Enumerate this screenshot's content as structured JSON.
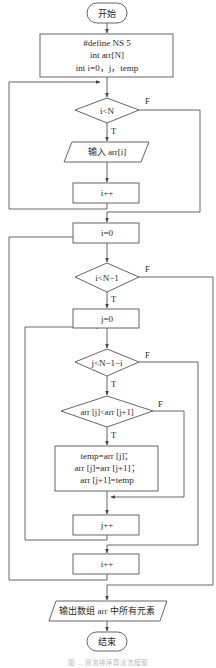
{
  "figure": {
    "type": "flowchart",
    "title": "冒泡排序算法流程图",
    "caption": "图 … 冒泡排序算法流程图"
  },
  "nodes": {
    "start": {
      "kind": "terminal",
      "lines": [
        "开始"
      ]
    },
    "init": {
      "kind": "process",
      "lines": [
        "#define NS 5",
        "int arr[N]",
        "int i=0，j，temp"
      ]
    },
    "cond1": {
      "kind": "decision",
      "lines": [
        "i<N"
      ]
    },
    "input": {
      "kind": "io",
      "lines": [
        "输入 arr[i]"
      ]
    },
    "inc_i1": {
      "kind": "process",
      "lines": [
        "i++"
      ]
    },
    "reset_i": {
      "kind": "process",
      "lines": [
        "i=0"
      ]
    },
    "cond2": {
      "kind": "decision",
      "lines": [
        "i<N−1"
      ]
    },
    "reset_j": {
      "kind": "process",
      "lines": [
        "j=0"
      ]
    },
    "cond3": {
      "kind": "decision",
      "lines": [
        "j<N−1−i"
      ]
    },
    "cond4": {
      "kind": "decision",
      "lines": [
        "arr [j]<arr [j+1]"
      ]
    },
    "swap": {
      "kind": "process",
      "lines": [
        "temp=arr [j]；",
        "arr [j]=arr [j+1]；",
        "arr [j+1]=temp"
      ]
    },
    "inc_j": {
      "kind": "process",
      "lines": [
        "j++"
      ]
    },
    "inc_i2": {
      "kind": "process",
      "lines": [
        "i++"
      ]
    },
    "output": {
      "kind": "io",
      "lines": [
        "输出数组 arr 中所有元素"
      ]
    },
    "end": {
      "kind": "terminal",
      "lines": [
        "结束"
      ]
    }
  },
  "edge_labels": {
    "true": "T",
    "false": "F"
  },
  "edges": [
    {
      "from": "start",
      "to": "init"
    },
    {
      "from": "init",
      "to": "cond1"
    },
    {
      "from": "cond1",
      "to": "input",
      "label": "T"
    },
    {
      "from": "cond1",
      "to": "reset_i",
      "label": "F"
    },
    {
      "from": "input",
      "to": "inc_i1"
    },
    {
      "from": "inc_i1",
      "to": "cond1"
    },
    {
      "from": "reset_i",
      "to": "cond2"
    },
    {
      "from": "cond2",
      "to": "reset_j",
      "label": "T"
    },
    {
      "from": "cond2",
      "to": "output",
      "label": "F"
    },
    {
      "from": "reset_j",
      "to": "cond3"
    },
    {
      "from": "cond3",
      "to": "cond4",
      "label": "T"
    },
    {
      "from": "cond3",
      "to": "inc_i2",
      "label": "F"
    },
    {
      "from": "cond4",
      "to": "swap",
      "label": "T"
    },
    {
      "from": "cond4",
      "to": "inc_j",
      "label": "F"
    },
    {
      "from": "swap",
      "to": "inc_j"
    },
    {
      "from": "inc_j",
      "to": "cond3"
    },
    {
      "from": "inc_i2",
      "to": "cond2"
    },
    {
      "from": "output",
      "to": "end"
    }
  ],
  "colors": {
    "stroke": "#555555",
    "text": "#2a2a2a",
    "background": "#ffffff"
  }
}
